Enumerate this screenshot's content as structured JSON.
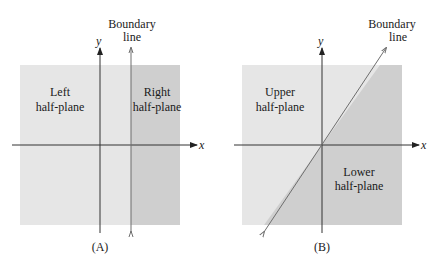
{
  "colors": {
    "light_region": "#e6e6e6",
    "dark_region": "#cfcfcf",
    "axis": "#333333",
    "boundary": "#6e6e6e"
  },
  "panels": [
    {
      "caption": "(A)",
      "x_axis_label": "x",
      "y_axis_label": "y",
      "boundary_label_line1": "Boundary",
      "boundary_label_line2": "line",
      "region1_line1": "Left",
      "region1_line2": "half-plane",
      "region2_line1": "Right",
      "region2_line2": "half-plane",
      "boundary_type": "vertical"
    },
    {
      "caption": "(B)",
      "x_axis_label": "x",
      "y_axis_label": "y",
      "boundary_label_line1": "Boundary",
      "boundary_label_line2": "line",
      "region1_line1": "Upper",
      "region1_line2": "half-plane",
      "region2_line1": "Lower",
      "region2_line2": "half-plane",
      "boundary_type": "diagonal through origin"
    }
  ]
}
